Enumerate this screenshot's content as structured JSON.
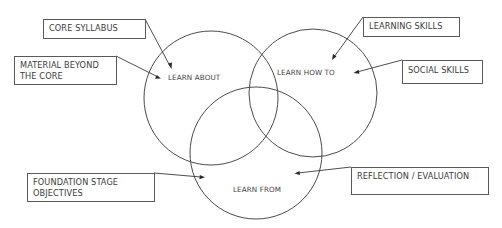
{
  "diagram": {
    "type": "venn",
    "circles": [
      {
        "id": "learn-about",
        "label": "LEARN ABOUT",
        "cx": 211,
        "cy": 98,
        "r": 67
      },
      {
        "id": "learn-how-to",
        "label": "LEARN HOW TO",
        "cx": 313,
        "cy": 93,
        "r": 64
      },
      {
        "id": "learn-from",
        "label": "LEARN FROM",
        "cx": 256,
        "cy": 153,
        "r": 66
      }
    ],
    "callouts": [
      {
        "id": "core-syllabus",
        "text": "CORE SYLLABUS",
        "points_to": "learn-about"
      },
      {
        "id": "material-beyond-core",
        "text": "MATERIAL BEYOND\nTHE CORE",
        "points_to": "learn-about"
      },
      {
        "id": "learning-skills",
        "text": "LEARNING SKILLS",
        "points_to": "learn-how-to"
      },
      {
        "id": "social-skills",
        "text": "SOCIAL SKILLS",
        "points_to": "learn-how-to"
      },
      {
        "id": "foundation-stage-objectives",
        "text": "FOUNDATION STAGE\nOBJECTIVES",
        "points_to": "learn-from"
      },
      {
        "id": "reflection-evaluation",
        "text": "REFLECTION / EVALUATION",
        "points_to": "learn-from"
      }
    ],
    "colors": {
      "line": "#4a4a4a",
      "text": "#3c3c3c",
      "background": "#ffffff"
    }
  }
}
